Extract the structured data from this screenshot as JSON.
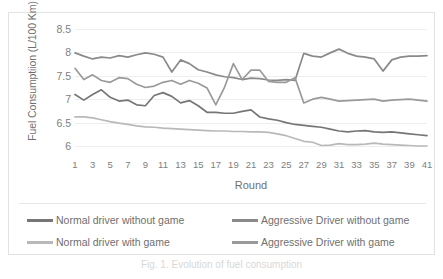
{
  "figure": {
    "caption": "Fig. 1. Evolution of fuel consumption"
  },
  "axes": {
    "ylabel": "Fuel Consumptiion (L/100 Km)",
    "xlabel": "Round",
    "yticks": [
      "8.5",
      "8",
      "7.5",
      "7",
      "6.5",
      "6"
    ],
    "xticks": [
      "1",
      "3",
      "5",
      "7",
      "9",
      "11",
      "13",
      "15",
      "17",
      "19",
      "21",
      "23",
      "25",
      "27",
      "29",
      "31",
      "33",
      "35",
      "37",
      "39",
      "41"
    ]
  },
  "legend": {
    "items": [
      {
        "label": "Normal driver without game",
        "color": "#767676"
      },
      {
        "label": "Aggressive Driver without game",
        "color": "#8a8a8a"
      },
      {
        "label": "Normal driver with game",
        "color": "#b9b9b9"
      },
      {
        "label": "Aggressive Driver with game",
        "color": "#9a9a9a"
      }
    ]
  },
  "chart_data": {
    "type": "line",
    "title": "",
    "xlabel": "Round",
    "ylabel": "Fuel Consumptiion (L/100 Km)",
    "xlim": [
      1,
      41
    ],
    "ylim": [
      5.85,
      8.5
    ],
    "ytick_values": [
      8.5,
      8,
      7.5,
      7,
      6.5,
      6
    ],
    "grid": true,
    "legend_position": "bottom",
    "x": [
      1,
      2,
      3,
      4,
      5,
      6,
      7,
      8,
      9,
      10,
      11,
      12,
      13,
      14,
      15,
      16,
      17,
      18,
      19,
      20,
      21,
      22,
      23,
      24,
      25,
      26,
      27,
      28,
      29,
      30,
      31,
      32,
      33,
      34,
      35,
      36,
      37,
      38,
      39,
      40,
      41
    ],
    "series": [
      {
        "name": "Aggressive Driver without game",
        "color": "#8a8a8a",
        "values": [
          7.99,
          7.92,
          7.86,
          7.9,
          7.88,
          7.93,
          7.9,
          7.95,
          7.99,
          7.96,
          7.9,
          7.58,
          7.84,
          7.76,
          7.63,
          7.58,
          7.52,
          7.48,
          7.46,
          7.42,
          7.45,
          7.44,
          7.41,
          7.4,
          7.42,
          7.4,
          7.98,
          7.92,
          7.9,
          7.99,
          8.07,
          7.98,
          7.92,
          7.9,
          7.86,
          7.6,
          7.84,
          7.9,
          7.92,
          7.92,
          7.93
        ]
      },
      {
        "name": "Aggressive Driver with game",
        "color": "#9a9a9a",
        "values": [
          7.66,
          7.42,
          7.52,
          7.4,
          7.36,
          7.46,
          7.44,
          7.32,
          7.25,
          7.28,
          7.36,
          7.4,
          7.32,
          7.4,
          7.34,
          7.24,
          6.88,
          7.26,
          7.76,
          7.42,
          7.62,
          7.62,
          7.38,
          7.36,
          7.36,
          7.46,
          6.92,
          7.0,
          7.04,
          7.0,
          6.96,
          6.97,
          6.98,
          6.99,
          7.0,
          6.96,
          6.98,
          6.99,
          7.0,
          6.98,
          6.96
        ]
      },
      {
        "name": "Normal driver without game",
        "color": "#767676",
        "values": [
          7.1,
          6.98,
          7.1,
          7.2,
          7.04,
          6.96,
          6.98,
          6.88,
          6.86,
          7.08,
          7.14,
          7.06,
          6.92,
          6.97,
          6.86,
          6.72,
          6.72,
          6.7,
          6.7,
          6.74,
          6.77,
          6.62,
          6.58,
          6.55,
          6.5,
          6.46,
          6.44,
          6.42,
          6.4,
          6.36,
          6.32,
          6.3,
          6.32,
          6.33,
          6.3,
          6.29,
          6.3,
          6.28,
          6.26,
          6.24,
          6.22
        ]
      },
      {
        "name": "Normal driver with game",
        "color": "#b9b9b9",
        "values": [
          6.62,
          6.62,
          6.6,
          6.56,
          6.52,
          6.49,
          6.46,
          6.43,
          6.41,
          6.4,
          6.38,
          6.37,
          6.36,
          6.35,
          6.34,
          6.33,
          6.32,
          6.32,
          6.31,
          6.31,
          6.3,
          6.3,
          6.29,
          6.26,
          6.22,
          6.16,
          6.1,
          6.08,
          6.01,
          6.02,
          6.05,
          6.03,
          6.03,
          6.04,
          6.06,
          6.04,
          6.03,
          6.02,
          6.01,
          6.0,
          6.0
        ]
      }
    ]
  }
}
